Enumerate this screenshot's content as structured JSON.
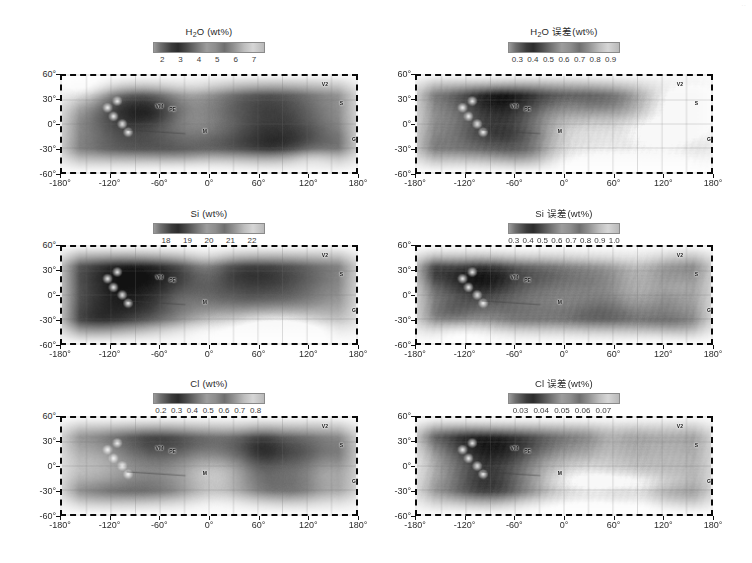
{
  "figure": {
    "type": "map-grid",
    "rows": 3,
    "cols": 2,
    "projection": "cylindrical",
    "corner_mark": "··"
  },
  "axes_common": {
    "ylabels": [
      "60°",
      "30°",
      "0°",
      "-30°",
      "-60°"
    ],
    "yvalues": [
      60,
      30,
      0,
      -30,
      -60
    ],
    "xlabels": [
      "-180°",
      "-120°",
      "-60°",
      "0°",
      "60°",
      "120°",
      "180°"
    ],
    "xvalues": [
      -180,
      -120,
      -60,
      0,
      60,
      120,
      180
    ],
    "ylim": [
      -60,
      60
    ],
    "xlim": [
      -180,
      180
    ],
    "grid": true,
    "border_style": "thick-dashed-black"
  },
  "feature_labels": [
    {
      "name": "VM",
      "text": "VM",
      "lon": -60,
      "lat": 22
    },
    {
      "name": "PE",
      "text": "PE",
      "lon": -44,
      "lat": 18
    },
    {
      "name": "M",
      "text": "M",
      "lon": -5,
      "lat": -8
    },
    {
      "name": "V2",
      "text": "V2",
      "lon": 140,
      "lat": 48
    },
    {
      "name": "S",
      "text": "S",
      "lon": 160,
      "lat": 25
    },
    {
      "name": "G",
      "text": "G",
      "lon": 175,
      "lat": -18
    }
  ],
  "panels": [
    {
      "id": "h2o",
      "position": "top-left",
      "colorbar": {
        "title_main": "H",
        "title_sub": "2",
        "title_rest": "O (wt%)",
        "title_full": "H₂O (wt%)",
        "ticks": [
          "2",
          "3",
          "4",
          "5",
          "6",
          "7"
        ],
        "tick_values": [
          2,
          3,
          4,
          5,
          6,
          7
        ],
        "vmin": 1.5,
        "vmax": 7.6,
        "cmap": "gray"
      }
    },
    {
      "id": "h2o_err",
      "position": "top-right",
      "colorbar": {
        "title_main": "H",
        "title_sub": "2",
        "title_rest": "O 误差(wt%)",
        "title_full": "H₂O 误差(wt%)",
        "ticks": [
          "0.3",
          "0.4",
          "0.5",
          "0.6",
          "0.7",
          "0.8",
          "0.9"
        ],
        "tick_values": [
          0.3,
          0.4,
          0.5,
          0.6,
          0.7,
          0.8,
          0.9
        ],
        "vmin": 0.24,
        "vmax": 0.96,
        "cmap": "gray"
      }
    },
    {
      "id": "si",
      "position": "middle-left",
      "colorbar": {
        "title_main": "",
        "title_sub": "",
        "title_rest": "Si (wt%)",
        "title_full": "Si (wt%)",
        "ticks": [
          "18",
          "19",
          "20",
          "21",
          "22"
        ],
        "tick_values": [
          18,
          19,
          20,
          21,
          22
        ],
        "vmin": 17.4,
        "vmax": 22.6,
        "cmap": "gray"
      }
    },
    {
      "id": "si_err",
      "position": "middle-right",
      "colorbar": {
        "title_main": "",
        "title_sub": "",
        "title_rest": "Si 误差(wt%)",
        "title_full": "Si 误差(wt%)",
        "ticks": [
          "0.3",
          "0.4",
          "0.5",
          "0.6",
          "0.7",
          "0.8",
          "0.9",
          "1.0"
        ],
        "tick_values": [
          0.3,
          0.4,
          0.5,
          0.6,
          0.7,
          0.8,
          0.9,
          1.0
        ],
        "vmin": 0.26,
        "vmax": 1.04,
        "cmap": "gray"
      }
    },
    {
      "id": "cl",
      "position": "bottom-left",
      "colorbar": {
        "title_main": "",
        "title_sub": "",
        "title_rest": "Cl (wt%)",
        "title_full": "Cl (wt%)",
        "ticks": [
          "0.2",
          "0.3",
          "0.4",
          "0.5",
          "0.6",
          "0.7",
          "0.8"
        ],
        "tick_values": [
          0.2,
          0.3,
          0.4,
          0.5,
          0.6,
          0.7,
          0.8
        ],
        "vmin": 0.15,
        "vmax": 0.86,
        "cmap": "gray"
      }
    },
    {
      "id": "cl_err",
      "position": "bottom-right",
      "colorbar": {
        "title_main": "",
        "title_sub": "",
        "title_rest": "Cl 误差(wt%)",
        "title_full": "Cl 误差(wt%)",
        "ticks": [
          "0.03",
          "0.04",
          "0.05",
          "0.06",
          "0.07"
        ],
        "tick_values": [
          0.03,
          0.04,
          0.05,
          0.06,
          0.07
        ],
        "vmin": 0.024,
        "vmax": 0.078,
        "cmap": "gray"
      }
    }
  ],
  "chart_data": {
    "type": "heatmap",
    "title": "",
    "xlabel": "Longitude",
    "ylabel": "Latitude",
    "xlim": [
      -180,
      180
    ],
    "ylim": [
      -60,
      60
    ],
    "grid": true,
    "legend": "colorbar-above-each-panel",
    "maps": [
      {
        "name": "H2O (wt%)",
        "units": "wt%",
        "range": [
          2,
          7
        ],
        "colorbar_ticks": [
          2,
          3,
          4,
          5,
          6,
          7
        ],
        "description": "Water content map of Mars, dark = low, light = high"
      },
      {
        "name": "H2O error (wt%)",
        "units": "wt%",
        "range": [
          0.3,
          0.9
        ],
        "colorbar_ticks": [
          0.3,
          0.4,
          0.5,
          0.6,
          0.7,
          0.8,
          0.9
        ],
        "description": "Uncertainty of water content"
      },
      {
        "name": "Si (wt%)",
        "units": "wt%",
        "range": [
          18,
          22
        ],
        "colorbar_ticks": [
          18,
          19,
          20,
          21,
          22
        ],
        "description": "Silicon abundance map"
      },
      {
        "name": "Si error (wt%)",
        "units": "wt%",
        "range": [
          0.3,
          1.0
        ],
        "colorbar_ticks": [
          0.3,
          0.4,
          0.5,
          0.6,
          0.7,
          0.8,
          0.9,
          1.0
        ],
        "description": "Uncertainty of silicon abundance"
      },
      {
        "name": "Cl (wt%)",
        "units": "wt%",
        "range": [
          0.2,
          0.8
        ],
        "colorbar_ticks": [
          0.2,
          0.3,
          0.4,
          0.5,
          0.6,
          0.7,
          0.8
        ],
        "description": "Chlorine abundance map"
      },
      {
        "name": "Cl error (wt%)",
        "units": "wt%",
        "range": [
          0.03,
          0.07
        ],
        "colorbar_ticks": [
          0.03,
          0.04,
          0.05,
          0.06,
          0.07
        ],
        "description": "Uncertainty of chlorine abundance"
      }
    ]
  }
}
